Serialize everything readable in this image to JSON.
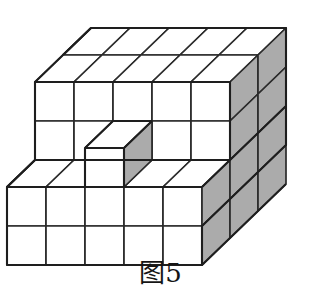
{
  "figure": {
    "caption": "图5",
    "colors": {
      "background": "#ffffff",
      "top_face": "#ffffff",
      "front_face": "#ffffff",
      "side_face": "#ababab",
      "edge_stroke": "#2b2b2b",
      "outline_stroke": "#1e1e1e",
      "caption_text": "#151515"
    },
    "counts": {
      "top_face_columns": 5,
      "top_face_rows": 2,
      "upper_front_columns": 5,
      "upper_front_rows": 2,
      "terrace_columns": 5,
      "terrace_rows": 1,
      "lower_front_columns": 5,
      "lower_front_rows": 2,
      "side_face_columns": 3,
      "side_face_upper_rows": 2,
      "side_face_lower_rows": 4,
      "protruding_cubes": 1
    },
    "projection": {
      "unit_width": 39,
      "unit_height": 39,
      "depth_dx": 28,
      "depth_dy": -27
    }
  }
}
